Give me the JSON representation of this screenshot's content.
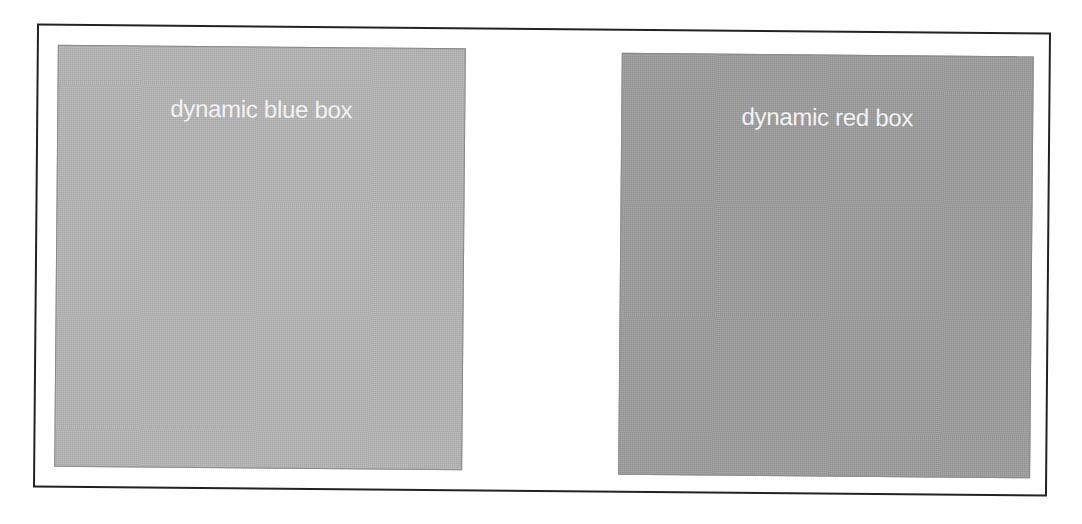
{
  "boxes": [
    {
      "id": "blue",
      "label": "dynamic blue box",
      "color": "#b5b5b5"
    },
    {
      "id": "red",
      "label": "dynamic red box",
      "color": "#9d9d9d"
    }
  ]
}
